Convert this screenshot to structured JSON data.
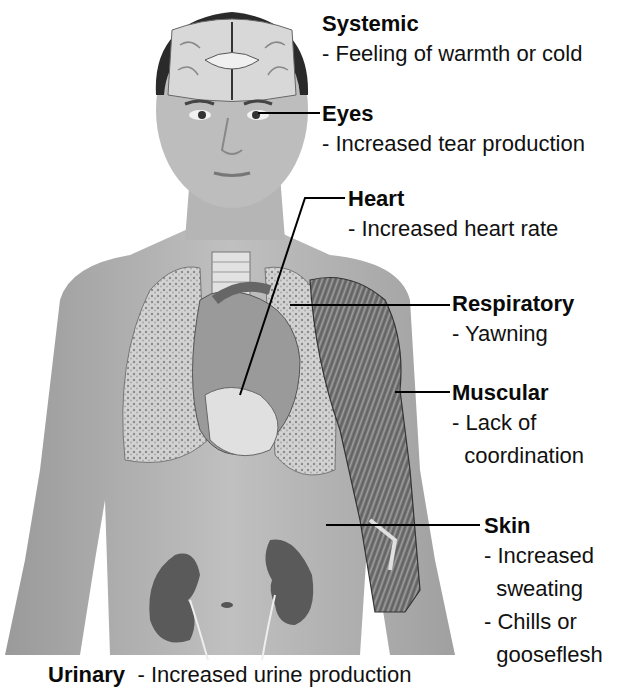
{
  "figure": {
    "organs_shown": [
      "brain",
      "eyes",
      "heart",
      "lungs",
      "arm-muscles",
      "kidneys"
    ]
  },
  "labels": [
    {
      "id": "systemic",
      "title": "Systemic",
      "items": [
        "- Feeling of warmth or cold"
      ]
    },
    {
      "id": "eyes",
      "title": "Eyes",
      "items": [
        "- Increased tear production"
      ]
    },
    {
      "id": "heart",
      "title": "Heart",
      "items": [
        "- Increased heart rate"
      ]
    },
    {
      "id": "respiratory",
      "title": "Respiratory",
      "items": [
        "- Yawning"
      ]
    },
    {
      "id": "muscular",
      "title": "Muscular",
      "items": [
        "- Lack of",
        "  coordination"
      ]
    },
    {
      "id": "skin",
      "title": "Skin",
      "items": [
        "- Increased",
        "  sweating",
        "- Chills or",
        "  gooseflesh"
      ]
    },
    {
      "id": "urinary",
      "title": "Urinary",
      "items": [
        "- Increased urine production"
      ]
    }
  ],
  "colors": {
    "background": "#ffffff",
    "skin": "#a9a9a9",
    "skin_light": "#c4c4c4",
    "hair": "#2a2a2a",
    "organ_light": "#d8d8d8",
    "organ_dark": "#6a6a6a",
    "kidney": "#555555",
    "leader_line": "#000000"
  }
}
